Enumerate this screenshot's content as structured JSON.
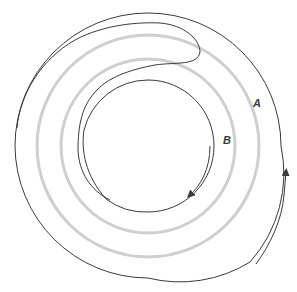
{
  "diagram": {
    "labels": {
      "a": "A",
      "b": "B"
    },
    "colors": {
      "stroke": "#3a3a3a",
      "guide": "#cfcfcf",
      "background": "#ffffff"
    },
    "center": [
      148,
      146
    ],
    "guide_circles_radii": [
      112,
      87
    ]
  }
}
